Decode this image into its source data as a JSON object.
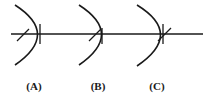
{
  "diagram": {
    "stroke_color": "#1a1a1a",
    "panels": [
      {
        "label": "(A)"
      },
      {
        "label": "(B)"
      },
      {
        "label": "(C)"
      }
    ]
  }
}
